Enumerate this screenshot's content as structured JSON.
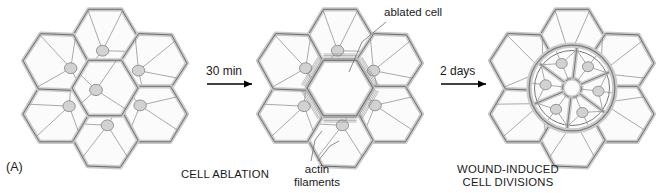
{
  "figure": {
    "panel_label": "(A)"
  },
  "steps": [
    {
      "time_label": "30 min",
      "caption": "CELL ABLATION"
    },
    {
      "time_label": "2 days",
      "caption": "WOUND-INDUCED\nCELL DIVISIONS"
    }
  ],
  "annotations": [
    {
      "id": "ablated-cell",
      "text": "ablated cell"
    },
    {
      "id": "actin-filaments",
      "text": "actin\nfilaments"
    }
  ],
  "colors": {
    "wall_stroke": "#6e6e6e",
    "wall_fill": "#c9c9c9",
    "nucleus_fill": "#d2d2d2",
    "nucleus_stroke": "#8a8a8a",
    "cytoskeleton_line": "#8d8d8d",
    "background": "#ffffff",
    "text": "#1a1a1a",
    "arrow": "#000000",
    "wound_ring": "#7a7a7a"
  },
  "panels": [
    {
      "id": "panel-intact",
      "name": "intact-epidermis",
      "cx": 105,
      "cy": 88,
      "cells": 7,
      "center_cell_ablated": false,
      "wound_ring": false
    },
    {
      "id": "panel-ablated",
      "name": "ablated-epidermis",
      "cx": 340,
      "cy": 88,
      "cells": 7,
      "center_cell_ablated": true,
      "wound_ring": false,
      "actin_cables": true
    },
    {
      "id": "panel-divided",
      "name": "divided-epidermis",
      "cx": 572,
      "cy": 88,
      "cells": 7,
      "center_cell_ablated": false,
      "wound_ring": true,
      "daughter_wedges": 6
    }
  ]
}
